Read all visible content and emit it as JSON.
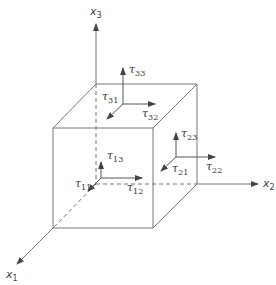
{
  "diagram": {
    "colors": {
      "line": "#666666",
      "text": "#333333",
      "background": "#ffffff"
    },
    "axes": [
      {
        "id": "x1",
        "label": "x",
        "sub": "1"
      },
      {
        "id": "x2",
        "label": "x",
        "sub": "2"
      },
      {
        "id": "x3",
        "label": "x",
        "sub": "3"
      }
    ],
    "stresses": {
      "top_face": [
        {
          "label": "τ",
          "sub": "33"
        },
        {
          "label": "τ",
          "sub": "31"
        },
        {
          "label": "τ",
          "sub": "32"
        }
      ],
      "right_face": [
        {
          "label": "τ",
          "sub": "23"
        },
        {
          "label": "τ",
          "sub": "21"
        },
        {
          "label": "τ",
          "sub": "22"
        }
      ],
      "front_face": [
        {
          "label": "τ",
          "sub": "13"
        },
        {
          "label": "τ",
          "sub": "11"
        },
        {
          "label": "τ",
          "sub": "12"
        }
      ]
    }
  }
}
